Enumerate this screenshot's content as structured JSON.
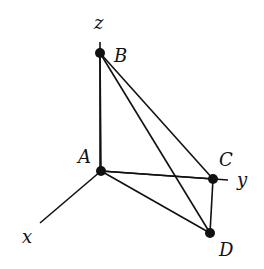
{
  "diagram": {
    "type": "3d-tetrahedron-on-axes",
    "stroke_color": "#111111",
    "axes": [
      {
        "name": "z",
        "label": "z",
        "from": [
          100,
          42
        ],
        "to": [
          100,
          171
        ]
      },
      {
        "name": "y",
        "label": "y",
        "from": [
          101,
          171
        ],
        "to": [
          228,
          180
        ]
      },
      {
        "name": "x",
        "label": "x",
        "from": [
          101,
          171
        ],
        "to": [
          40,
          223
        ]
      }
    ],
    "points": [
      {
        "id": "A",
        "label": "A",
        "x": 101,
        "y": 171
      },
      {
        "id": "B",
        "label": "B",
        "x": 100,
        "y": 53
      },
      {
        "id": "C",
        "label": "C",
        "x": 213,
        "y": 179
      },
      {
        "id": "D",
        "label": "D",
        "x": 210,
        "y": 233
      }
    ],
    "edges": [
      [
        "A",
        "B"
      ],
      [
        "A",
        "C"
      ],
      [
        "A",
        "D"
      ],
      [
        "B",
        "C"
      ],
      [
        "B",
        "D"
      ],
      [
        "C",
        "D"
      ]
    ]
  }
}
